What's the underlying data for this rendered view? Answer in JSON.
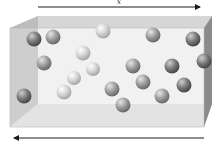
{
  "diagram": {
    "type": "gas-particles-in-box",
    "top_arrow": {
      "label": "x",
      "direction": "right"
    },
    "bottom_arrow": {
      "label": "",
      "direction": "left"
    },
    "colors": {
      "background": "#ffffff",
      "front_face": "#e9e9e9",
      "back_face": "#f3f3f3",
      "left_side": "#b9b9b9",
      "right_side": "#8a8a8a",
      "top_face": "#d6d6d6",
      "bottom_face": "#dcdcdc",
      "arrow": "#1a1a1a"
    },
    "particles": [
      {
        "cx": 34,
        "cy": 39,
        "r": 7.5,
        "shade": "dark"
      },
      {
        "cx": 53,
        "cy": 37,
        "r": 7.5,
        "shade": "medium"
      },
      {
        "cx": 103,
        "cy": 31,
        "r": 7.5,
        "shade": "light"
      },
      {
        "cx": 153,
        "cy": 35,
        "r": 7.5,
        "shade": "medium"
      },
      {
        "cx": 193,
        "cy": 39,
        "r": 7.5,
        "shade": "dark"
      },
      {
        "cx": 83,
        "cy": 53,
        "r": 7.5,
        "shade": "light"
      },
      {
        "cx": 44,
        "cy": 63,
        "r": 7.5,
        "shade": "medium"
      },
      {
        "cx": 93,
        "cy": 69,
        "r": 7,
        "shade": "light"
      },
      {
        "cx": 133,
        "cy": 66,
        "r": 7.5,
        "shade": "medium"
      },
      {
        "cx": 172,
        "cy": 66,
        "r": 7.5,
        "shade": "dark"
      },
      {
        "cx": 204,
        "cy": 61,
        "r": 7.5,
        "shade": "dark"
      },
      {
        "cx": 74,
        "cy": 78,
        "r": 7,
        "shade": "light"
      },
      {
        "cx": 143,
        "cy": 82,
        "r": 7.5,
        "shade": "medium"
      },
      {
        "cx": 184,
        "cy": 85,
        "r": 7.5,
        "shade": "dark"
      },
      {
        "cx": 112,
        "cy": 89,
        "r": 7.5,
        "shade": "medium"
      },
      {
        "cx": 64,
        "cy": 92,
        "r": 7.5,
        "shade": "light"
      },
      {
        "cx": 24,
        "cy": 96,
        "r": 7.5,
        "shade": "dark"
      },
      {
        "cx": 162,
        "cy": 96,
        "r": 7.5,
        "shade": "medium"
      },
      {
        "cx": 123,
        "cy": 105,
        "r": 7.5,
        "shade": "medium"
      }
    ]
  }
}
